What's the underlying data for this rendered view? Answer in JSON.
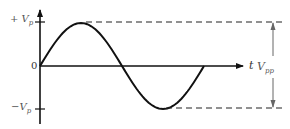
{
  "diagram": {
    "labels": {
      "positive_peak": {
        "sign": "+",
        "symbol": "V",
        "subscript": "p"
      },
      "origin": "0",
      "negative_peak": {
        "sign": "−",
        "symbol": "V",
        "subscript": "p"
      },
      "time_axis": "t",
      "peak_to_peak": {
        "symbol": "V",
        "subscript": "pp"
      }
    },
    "colors": {
      "curve": "#111111",
      "axes": "#111111",
      "dashed_lines": "#222222",
      "vpp_arrow": "#666666",
      "label_text": "#555555"
    },
    "waveform": {
      "type": "sine",
      "cycles": 1,
      "start_x": 40,
      "end_x": 204,
      "baseline_y": 66,
      "amplitude_px": 43
    }
  }
}
